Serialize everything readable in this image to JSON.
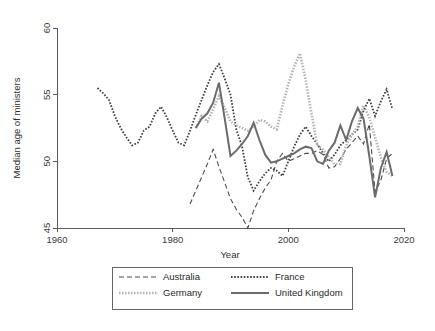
{
  "figure": {
    "background": "#ffffff",
    "plot_area": {
      "x": 57,
      "y": 28,
      "width": 347,
      "height": 200
    }
  },
  "chart_data": {
    "type": "line",
    "title": "",
    "xlabel": "Year",
    "ylabel": "Median age of ministers",
    "xlim": [
      1960,
      2020
    ],
    "ylim": [
      45,
      60
    ],
    "xticks": [
      1960,
      1980,
      2000,
      2020
    ],
    "yticks": [
      45,
      50,
      55,
      60
    ],
    "xtick_labels": [
      "1960",
      "1980",
      "2000",
      "2020"
    ],
    "ytick_labels": [
      "45",
      "50",
      "55",
      "60"
    ],
    "grid": false,
    "legend_position": "below-axis",
    "series": [
      {
        "name": "Australia",
        "style": "dashed",
        "color": "#4d4d4d",
        "width": 1.1,
        "dash": "5,3",
        "x": [
          1983,
          1984,
          1985,
          1986,
          1987,
          1988,
          1989,
          1990,
          1991,
          1992,
          1993,
          1994,
          1995,
          1996,
          1997,
          1998,
          1999,
          2000,
          2001,
          2002,
          2003,
          2004,
          2005,
          2006,
          2007,
          2008,
          2009,
          2010,
          2011,
          2012,
          2013,
          2014,
          2015,
          2016,
          2017,
          2018
        ],
        "y": [
          46.8,
          47.8,
          48.8,
          49.8,
          50.9,
          49.6,
          48.4,
          47.2,
          46.4,
          45.8,
          45.0,
          46.3,
          47.2,
          48.0,
          48.6,
          50.0,
          50.6,
          50.0,
          50.2,
          50.4,
          50.6,
          50.6,
          50.8,
          50.5,
          49.5,
          49.6,
          50.2,
          50.9,
          51.4,
          51.9,
          51.3,
          52.8,
          47.7,
          48.6,
          50.2,
          50.6
        ]
      },
      {
        "name": "France",
        "style": "dotted",
        "color": "#3f3f3f",
        "width": 1.8,
        "dash": "1.6,1.6",
        "x": [
          1967,
          1968,
          1969,
          1970,
          1971,
          1972,
          1973,
          1974,
          1975,
          1976,
          1977,
          1978,
          1979,
          1980,
          1981,
          1982,
          1983,
          1984,
          1985,
          1986,
          1987,
          1988,
          1989,
          1990,
          1991,
          1992,
          1993,
          1994,
          1995,
          1996,
          1997,
          1998,
          1999,
          2000,
          2001,
          2002,
          2003,
          2004,
          2005,
          2006,
          2007,
          2008,
          2009,
          2010,
          2011,
          2012,
          2013,
          2014,
          2015,
          2016,
          2017,
          2018
        ],
        "y": [
          55.5,
          55.1,
          54.6,
          53.4,
          52.5,
          51.8,
          51.2,
          51.4,
          52.3,
          52.6,
          53.6,
          54.1,
          53.3,
          52.3,
          51.4,
          51.2,
          52.3,
          53.5,
          54.6,
          55.7,
          56.7,
          57.3,
          56.2,
          55.0,
          52.4,
          51.1,
          48.8,
          47.8,
          48.5,
          49.1,
          49.5,
          49.3,
          48.9,
          50.0,
          51.1,
          52.0,
          52.6,
          51.9,
          51.3,
          50.6,
          50.0,
          50.5,
          51.2,
          51.6,
          52.0,
          52.4,
          53.8,
          54.7,
          53.4,
          54.5,
          55.4,
          53.9
        ]
      },
      {
        "name": "Germany",
        "style": "dotted-thick",
        "color": "#b5b5b5",
        "width": 2.6,
        "dash": "1.5,1.5",
        "x": [
          1984,
          1985,
          1986,
          1987,
          1988,
          1989,
          1990,
          1991,
          1992,
          1993,
          1994,
          1995,
          1996,
          1997,
          1998,
          1999,
          2000,
          2001,
          2002,
          2003,
          2004,
          2005,
          2006,
          2007,
          2008,
          2009,
          2010,
          2011,
          2012,
          2013,
          2014,
          2015,
          2016,
          2017,
          2018
        ],
        "y": [
          52.5,
          53.4,
          53.0,
          53.9,
          54.9,
          54.0,
          53.0,
          52.7,
          52.5,
          52.3,
          52.6,
          53.1,
          53.0,
          52.6,
          52.4,
          54.2,
          55.8,
          57.1,
          58.1,
          56.1,
          53.6,
          51.2,
          50.9,
          50.3,
          49.8,
          49.8,
          51.2,
          52.0,
          52.6,
          54.2,
          53.3,
          51.8,
          50.3,
          49.2,
          48.9
        ]
      },
      {
        "name": "United Kingdom",
        "style": "solid",
        "color": "#6b6b6b",
        "width": 2.0,
        "dash": "",
        "x": [
          1984,
          1985,
          1986,
          1987,
          1988,
          1989,
          1990,
          1991,
          1992,
          1993,
          1994,
          1995,
          1996,
          1997,
          1998,
          1999,
          2000,
          2001,
          2002,
          2003,
          2004,
          2005,
          2006,
          2007,
          2008,
          2009,
          2010,
          2011,
          2012,
          2013,
          2014,
          2015,
          2016,
          2017,
          2018
        ],
        "y": [
          52.5,
          53.2,
          53.6,
          54.4,
          55.9,
          53.2,
          50.4,
          50.8,
          51.3,
          51.9,
          52.9,
          51.6,
          50.5,
          49.9,
          50.0,
          50.2,
          50.4,
          50.6,
          50.9,
          51.1,
          51.0,
          50.0,
          49.8,
          50.8,
          51.4,
          52.7,
          51.6,
          53.0,
          54.0,
          53.2,
          50.4,
          47.3,
          49.5,
          50.7,
          48.9
        ]
      }
    ]
  },
  "legend": {
    "entries": [
      {
        "label": "Australia",
        "key": "australia"
      },
      {
        "label": "France",
        "key": "france"
      },
      {
        "label": "Germany",
        "key": "germany"
      },
      {
        "label": "United Kingdom",
        "key": "united-kingdom"
      }
    ]
  }
}
